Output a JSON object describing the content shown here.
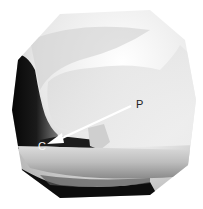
{
  "image": {
    "type": "radiograph",
    "shape": "circular-field",
    "colors": {
      "background": "#ffffff",
      "dark": "#0a0a0a",
      "mid": "#9a9a9a",
      "light": "#f2f2f2"
    }
  },
  "annotations": {
    "p_label": "P",
    "c_label": "C",
    "arrow": {
      "from": [
        131,
        106
      ],
      "to": [
        49,
        143
      ],
      "color": "#ffffff"
    }
  }
}
